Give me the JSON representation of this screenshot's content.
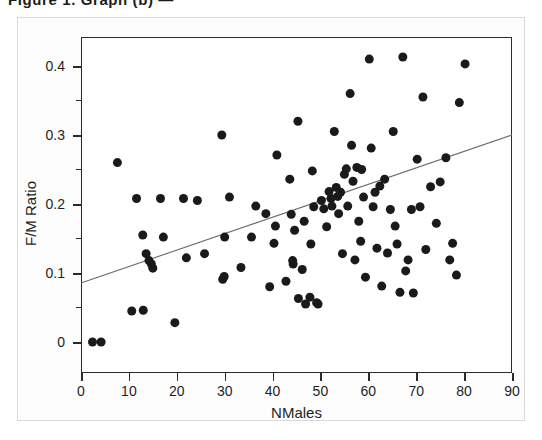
{
  "caption": {
    "clipped_text": "Figure 1. Graph (b) —"
  },
  "axes": {
    "x_title": "NMales",
    "y_title": "F/M Ratio",
    "x_ticks": [
      "0",
      "10",
      "20",
      "30",
      "40",
      "50",
      "60",
      "70",
      "80",
      "90"
    ],
    "y_ticks": [
      "0",
      "0.1",
      "0.2",
      "0.3",
      "0.4"
    ]
  },
  "colors": {
    "point": "#1a1a1a",
    "trendline": "#6b6b6b",
    "frame": "#2b2b2b",
    "background": "#ffffff"
  },
  "chart_data": {
    "type": "scatter",
    "title": "",
    "xlabel": "NMales",
    "ylabel": "F/M Ratio",
    "xlim": [
      0,
      90
    ],
    "ylim": [
      0,
      0.44
    ],
    "x_ticks": [
      0,
      10,
      20,
      30,
      40,
      50,
      60,
      70,
      80,
      90
    ],
    "y_ticks": [
      0,
      0.1,
      0.2,
      0.3,
      0.4
    ],
    "grid": false,
    "legend": null,
    "marker": "filled-circle",
    "marker_size_px": 9,
    "series": [
      {
        "name": "observations",
        "points": [
          [
            2.4,
            0.0
          ],
          [
            4.2,
            0.0
          ],
          [
            7.6,
            0.26
          ],
          [
            11.6,
            0.208
          ],
          [
            12.9,
            0.155
          ],
          [
            10.6,
            0.045
          ],
          [
            13.0,
            0.046
          ],
          [
            14.2,
            0.118
          ],
          [
            14.7,
            0.113
          ],
          [
            15.0,
            0.107
          ],
          [
            13.6,
            0.128
          ],
          [
            17.2,
            0.152
          ],
          [
            16.6,
            0.208
          ],
          [
            19.6,
            0.028
          ],
          [
            21.4,
            0.208
          ],
          [
            22.0,
            0.122
          ],
          [
            24.3,
            0.205
          ],
          [
            25.8,
            0.128
          ],
          [
            29.4,
            0.3
          ],
          [
            30.0,
            0.152
          ],
          [
            29.6,
            0.091
          ],
          [
            29.9,
            0.095
          ],
          [
            31.0,
            0.21
          ],
          [
            33.4,
            0.108
          ],
          [
            35.6,
            0.152
          ],
          [
            36.5,
            0.197
          ],
          [
            38.6,
            0.186
          ],
          [
            39.4,
            0.08
          ],
          [
            40.3,
            0.143
          ],
          [
            40.6,
            0.168
          ],
          [
            40.9,
            0.271
          ],
          [
            42.8,
            0.088
          ],
          [
            43.6,
            0.236
          ],
          [
            43.9,
            0.185
          ],
          [
            44.2,
            0.118
          ],
          [
            44.3,
            0.113
          ],
          [
            44.6,
            0.162
          ],
          [
            45.3,
            0.32
          ],
          [
            45.4,
            0.063
          ],
          [
            46.2,
            0.105
          ],
          [
            46.6,
            0.175
          ],
          [
            46.9,
            0.055
          ],
          [
            47.8,
            0.065
          ],
          [
            48.0,
            0.142
          ],
          [
            48.3,
            0.248
          ],
          [
            48.6,
            0.196
          ],
          [
            49.2,
            0.057
          ],
          [
            49.5,
            0.055
          ],
          [
            50.2,
            0.205
          ],
          [
            50.7,
            0.193
          ],
          [
            51.3,
            0.167
          ],
          [
            51.8,
            0.218
          ],
          [
            52.2,
            0.208
          ],
          [
            52.4,
            0.197
          ],
          [
            52.9,
            0.305
          ],
          [
            53.3,
            0.224
          ],
          [
            53.6,
            0.211
          ],
          [
            53.8,
            0.186
          ],
          [
            54.2,
            0.217
          ],
          [
            54.6,
            0.128
          ],
          [
            55.0,
            0.243
          ],
          [
            55.4,
            0.251
          ],
          [
            55.7,
            0.197
          ],
          [
            56.2,
            0.36
          ],
          [
            56.5,
            0.285
          ],
          [
            56.8,
            0.233
          ],
          [
            57.2,
            0.119
          ],
          [
            57.6,
            0.253
          ],
          [
            58.0,
            0.175
          ],
          [
            58.4,
            0.146
          ],
          [
            58.6,
            0.25
          ],
          [
            59.0,
            0.21
          ],
          [
            59.4,
            0.094
          ],
          [
            60.2,
            0.41
          ],
          [
            60.6,
            0.281
          ],
          [
            61.0,
            0.196
          ],
          [
            61.4,
            0.217
          ],
          [
            61.8,
            0.136
          ],
          [
            62.4,
            0.226
          ],
          [
            62.8,
            0.081
          ],
          [
            63.4,
            0.236
          ],
          [
            64.0,
            0.129
          ],
          [
            64.6,
            0.192
          ],
          [
            65.2,
            0.305
          ],
          [
            65.6,
            0.168
          ],
          [
            66.0,
            0.142
          ],
          [
            66.6,
            0.072
          ],
          [
            67.2,
            0.413
          ],
          [
            67.8,
            0.103
          ],
          [
            68.3,
            0.119
          ],
          [
            69.0,
            0.192
          ],
          [
            69.4,
            0.071
          ],
          [
            70.2,
            0.265
          ],
          [
            70.8,
            0.196
          ],
          [
            71.4,
            0.355
          ],
          [
            72.0,
            0.134
          ],
          [
            73.0,
            0.225
          ],
          [
            74.2,
            0.172
          ],
          [
            75.0,
            0.232
          ],
          [
            76.2,
            0.267
          ],
          [
            77.0,
            0.119
          ],
          [
            77.6,
            0.143
          ],
          [
            78.4,
            0.097
          ],
          [
            79.0,
            0.347
          ],
          [
            80.2,
            0.403
          ]
        ]
      }
    ],
    "trendline": {
      "type": "linear-fit",
      "x_endpoints": [
        0,
        90
      ],
      "y_endpoints": [
        0.0855,
        0.3
      ],
      "slope": 0.002383,
      "intercept": 0.0855
    }
  }
}
